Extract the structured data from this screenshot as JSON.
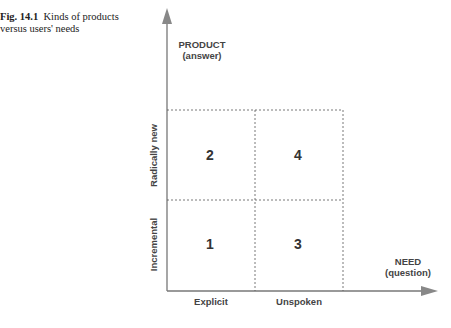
{
  "caption": {
    "fig": "Fig. 14.1",
    "line1": "Kinds of products",
    "line2": "versus users' needs"
  },
  "y_axis": {
    "title": "PRODUCT",
    "subtitle": "(answer)",
    "categories": [
      "Incremental",
      "Radically new"
    ]
  },
  "x_axis": {
    "title": "NEED",
    "subtitle": "(question)",
    "categories": [
      "Explicit",
      "Unspoken"
    ]
  },
  "quadrants": [
    {
      "id": "1",
      "x": "Explicit",
      "y": "Incremental"
    },
    {
      "id": "2",
      "x": "Explicit",
      "y": "Radically new"
    },
    {
      "id": "3",
      "x": "Unspoken",
      "y": "Incremental"
    },
    {
      "id": "4",
      "x": "Unspoken",
      "y": "Radically new"
    }
  ]
}
